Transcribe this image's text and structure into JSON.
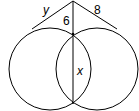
{
  "diagram": {
    "type": "geometry-two-intersecting-circles-tangents-secant",
    "labels": {
      "left_tangent": "y",
      "right_tangent": "8",
      "external_secant_segment": "6",
      "common_chord": "x"
    },
    "colors": {
      "stroke": "#000000",
      "background": "#ffffff"
    }
  }
}
